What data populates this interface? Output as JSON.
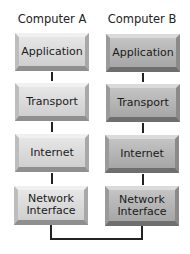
{
  "columns": [
    {
      "title": "Computer A",
      "layers": [
        "Application",
        "Transport",
        "Internet",
        "Network\nInterface"
      ]
    },
    {
      "title": "Computer B",
      "layers": [
        "Application",
        "Transport",
        "Internet",
        "Network\nInterface"
      ]
    }
  ],
  "layer_labels": {
    "application": "Application",
    "transport": "Transport",
    "internet": "Internet",
    "network_interface_1": "Network",
    "network_interface_2": "Interface"
  },
  "colors": {
    "computer_a_box": "#d8d8d8",
    "computer_b_box": "#b0b0b0",
    "connector": "#222222"
  }
}
